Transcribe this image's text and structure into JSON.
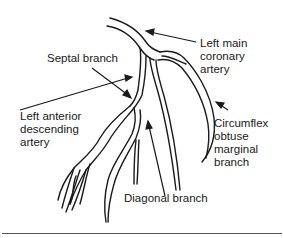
{
  "diagram": {
    "labels": {
      "left_main": "Left main\ncoronary\nartery",
      "septal": "Septal branch",
      "lad": "Left anterior\ndescending\nartery",
      "circumflex": "Circumflex\nobtuse\nmarginal\nbranch",
      "diagonal": "Diagonal branch"
    },
    "colors": {
      "line": "#1a1a1a",
      "background": "#ffffff"
    }
  }
}
